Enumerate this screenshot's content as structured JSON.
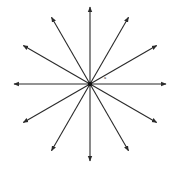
{
  "diagram": {
    "type": "radial-arrows",
    "center": {
      "x": 90,
      "y": 84
    },
    "radius": 77,
    "arrow_count": 12,
    "angle_step_deg": 30,
    "stroke_color": "#2a2a2a",
    "background": "#ffffff",
    "angle_label": "a",
    "arrows": [
      {
        "angle": 0
      },
      {
        "angle": 30
      },
      {
        "angle": 60
      },
      {
        "angle": 90
      },
      {
        "angle": 120
      },
      {
        "angle": 150
      },
      {
        "angle": 180
      },
      {
        "angle": 210
      },
      {
        "angle": 240
      },
      {
        "angle": 270
      },
      {
        "angle": 300
      },
      {
        "angle": 330
      }
    ]
  }
}
